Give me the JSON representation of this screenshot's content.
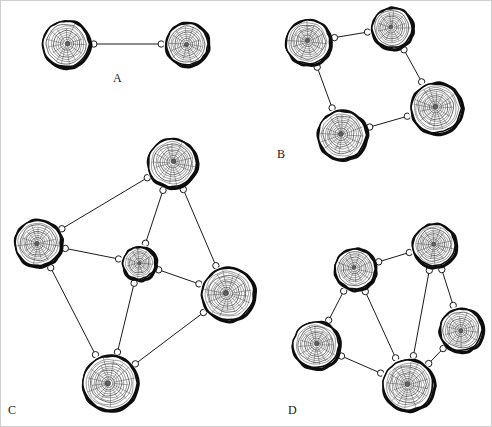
{
  "figure": {
    "width": 492,
    "height": 427,
    "background_color": "#ffffff",
    "border_color": "#cfcfcf",
    "edge_color": "#1a1a1a",
    "node_outer_ring_color": "#0d0d0d",
    "node_ring_color": "#3c3c3c",
    "node_fill_color": "#ffffff",
    "connector_fill_color": "#ffffff",
    "connector_stroke_color": "#1a1a1a"
  },
  "panels": [
    {
      "id": "panel-a",
      "label": "A",
      "label_x": 113,
      "label_y": 72,
      "node_count": 2,
      "edge_count": 1,
      "nodes": [
        {
          "id": "a1",
          "cx": 66,
          "cy": 44,
          "r": 24,
          "rings": 9
        },
        {
          "id": "a2",
          "cx": 187,
          "cy": 44,
          "r": 22,
          "rings": 9
        }
      ],
      "edges": [
        {
          "from": "a1",
          "to": "a2"
        }
      ]
    },
    {
      "id": "panel-b",
      "label": "B",
      "label_x": 277,
      "label_y": 148,
      "node_count": 4,
      "edge_count": 4,
      "nodes": [
        {
          "id": "b1",
          "cx": 308,
          "cy": 42,
          "r": 23,
          "rings": 10
        },
        {
          "id": "b2",
          "cx": 392,
          "cy": 28,
          "r": 21,
          "rings": 9
        },
        {
          "id": "b3",
          "cx": 436,
          "cy": 108,
          "r": 26,
          "rings": 11
        },
        {
          "id": "b4",
          "cx": 342,
          "cy": 135,
          "r": 25,
          "rings": 10
        }
      ],
      "edges": [
        {
          "from": "b1",
          "to": "b2"
        },
        {
          "from": "b2",
          "to": "b3"
        },
        {
          "from": "b3",
          "to": "b4"
        },
        {
          "from": "b4",
          "to": "b1"
        }
      ]
    },
    {
      "id": "panel-c",
      "label": "C",
      "label_x": 8,
      "label_y": 404,
      "node_count": 5,
      "edge_count": 8,
      "nodes": [
        {
          "id": "c-top",
          "cx": 172,
          "cy": 163,
          "r": 25,
          "rings": 10
        },
        {
          "id": "c-left",
          "cx": 38,
          "cy": 243,
          "r": 24,
          "rings": 10
        },
        {
          "id": "c-center",
          "cx": 139,
          "cy": 263,
          "r": 17,
          "rings": 8
        },
        {
          "id": "c-right",
          "cx": 228,
          "cy": 294,
          "r": 27,
          "rings": 11
        },
        {
          "id": "c-bottom",
          "cx": 110,
          "cy": 383,
          "r": 28,
          "rings": 11
        }
      ],
      "edges": [
        {
          "from": "c-top",
          "to": "c-left"
        },
        {
          "from": "c-top",
          "to": "c-center"
        },
        {
          "from": "c-top",
          "to": "c-right"
        },
        {
          "from": "c-left",
          "to": "c-center"
        },
        {
          "from": "c-left",
          "to": "c-bottom"
        },
        {
          "from": "c-center",
          "to": "c-right"
        },
        {
          "from": "c-center",
          "to": "c-bottom"
        },
        {
          "from": "c-right",
          "to": "c-bottom"
        }
      ]
    },
    {
      "id": "panel-d",
      "label": "D",
      "label_x": 288,
      "label_y": 404,
      "node_count": 5,
      "edge_count": 7,
      "nodes": [
        {
          "id": "d-top",
          "cx": 434,
          "cy": 245,
          "r": 22,
          "rings": 10
        },
        {
          "id": "d-upleft",
          "cx": 355,
          "cy": 269,
          "r": 21,
          "rings": 9
        },
        {
          "id": "d-right",
          "cx": 461,
          "cy": 330,
          "r": 22,
          "rings": 9
        },
        {
          "id": "d-left",
          "cx": 316,
          "cy": 345,
          "r": 24,
          "rings": 10
        },
        {
          "id": "d-bottom",
          "cx": 408,
          "cy": 385,
          "r": 26,
          "rings": 11
        }
      ],
      "edges": [
        {
          "from": "d-top",
          "to": "d-upleft"
        },
        {
          "from": "d-top",
          "to": "d-right"
        },
        {
          "from": "d-top",
          "to": "d-bottom"
        },
        {
          "from": "d-upleft",
          "to": "d-left"
        },
        {
          "from": "d-upleft",
          "to": "d-bottom"
        },
        {
          "from": "d-left",
          "to": "d-bottom"
        },
        {
          "from": "d-right",
          "to": "d-bottom"
        }
      ]
    }
  ]
}
